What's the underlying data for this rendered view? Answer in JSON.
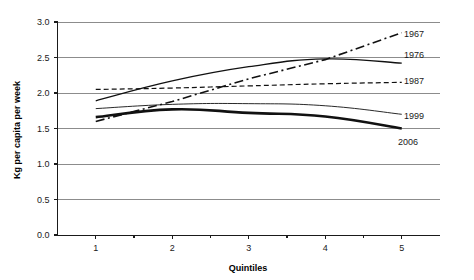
{
  "chart_data": {
    "type": "line",
    "title": "",
    "xlabel": "Quintiles",
    "ylabel": "Kg per capita per week",
    "categories": [
      "1",
      "2",
      "3",
      "4",
      "5"
    ],
    "x": [
      1,
      2,
      3,
      4,
      5
    ],
    "xlim": [
      0.5,
      5.5
    ],
    "ylim": [
      0.0,
      3.0
    ],
    "yticks": [
      "0.0",
      "0.5",
      "1.0",
      "1.5",
      "2.0",
      "2.5",
      "3.0"
    ],
    "ytick_values": [
      0.0,
      0.5,
      1.0,
      1.5,
      2.0,
      2.5,
      3.0
    ],
    "grid": true,
    "legend_position": "right-inline-at-line-ends",
    "series": [
      {
        "name": "1967",
        "label": "1967",
        "style": "dash-dot",
        "width": 1.6,
        "color": "#111111",
        "values": [
          1.6,
          1.88,
          2.2,
          2.47,
          2.85
        ]
      },
      {
        "name": "1976",
        "label": "1976",
        "style": "solid",
        "width": 1.3,
        "color": "#111111",
        "values": [
          1.89,
          2.17,
          2.37,
          2.48,
          2.42
        ]
      },
      {
        "name": "1987",
        "label": "1987",
        "style": "dashed",
        "width": 1.2,
        "color": "#111111",
        "values": [
          2.05,
          2.07,
          2.1,
          2.13,
          2.15
        ]
      },
      {
        "name": "1999",
        "label": "1999",
        "style": "solid-thin",
        "width": 0.9,
        "color": "#111111",
        "values": [
          1.78,
          1.84,
          1.85,
          1.82,
          1.7
        ]
      },
      {
        "name": "2006",
        "label": "2006",
        "style": "solid-thick",
        "width": 2.6,
        "color": "#111111",
        "values": [
          1.66,
          1.77,
          1.72,
          1.67,
          1.5
        ]
      }
    ]
  },
  "axes": {
    "y_title": "Kg per capita per week",
    "x_title": "Quintiles"
  }
}
